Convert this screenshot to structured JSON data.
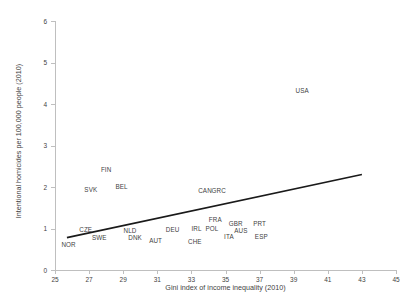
{
  "chart_data": {
    "type": "scatter",
    "title": "",
    "xlabel": "Gini index of income inequality (2010)",
    "ylabel": "Intentional homicides per 100,000 people (2010)",
    "xlim": [
      25,
      45
    ],
    "ylim": [
      0,
      6
    ],
    "xticks": [
      25,
      27,
      29,
      31,
      33,
      35,
      37,
      39,
      41,
      43,
      45
    ],
    "yticks": [
      0,
      1,
      2,
      3,
      4,
      5,
      6
    ],
    "grid": false,
    "legend": null,
    "marker_style": "text-label-only",
    "points": [
      {
        "label": "NOR",
        "x": 25.8,
        "y": 0.62
      },
      {
        "label": "CZE",
        "x": 26.8,
        "y": 0.98
      },
      {
        "label": "SWE",
        "x": 27.6,
        "y": 0.8
      },
      {
        "label": "SVK",
        "x": 27.1,
        "y": 1.95
      },
      {
        "label": "FIN",
        "x": 28.0,
        "y": 2.43
      },
      {
        "label": "BEL",
        "x": 28.9,
        "y": 2.03
      },
      {
        "label": "NLD",
        "x": 29.4,
        "y": 0.96
      },
      {
        "label": "DNK",
        "x": 29.7,
        "y": 0.79
      },
      {
        "label": "AUT",
        "x": 30.9,
        "y": 0.73
      },
      {
        "label": "DEU",
        "x": 31.9,
        "y": 0.98
      },
      {
        "label": "CHE",
        "x": 33.2,
        "y": 0.7
      },
      {
        "label": "IRL",
        "x": 33.3,
        "y": 1.02
      },
      {
        "label": "POL",
        "x": 34.2,
        "y": 1.02
      },
      {
        "label": "FRA",
        "x": 34.4,
        "y": 1.23
      },
      {
        "label": "CAN",
        "x": 33.8,
        "y": 1.93
      },
      {
        "label": "GRC",
        "x": 34.6,
        "y": 1.93
      },
      {
        "label": "GBR",
        "x": 35.6,
        "y": 1.13
      },
      {
        "label": "AUS",
        "x": 35.9,
        "y": 0.97
      },
      {
        "label": "ITA",
        "x": 35.2,
        "y": 0.82
      },
      {
        "label": "PRT",
        "x": 37.0,
        "y": 1.13
      },
      {
        "label": "ESP",
        "x": 37.1,
        "y": 0.82
      },
      {
        "label": "USA",
        "x": 39.5,
        "y": 4.33
      }
    ],
    "trendline": {
      "type": "linear",
      "x_start": 25.7,
      "y_start": 0.78,
      "x_end": 43.0,
      "y_end": 2.3,
      "color": "#1a1a1a",
      "width_px": 1.6
    },
    "colors": {
      "axis": "#bfbfbf",
      "text": "#3f3f3f",
      "trendline": "#1a1a1a",
      "background": "#ffffff"
    }
  }
}
